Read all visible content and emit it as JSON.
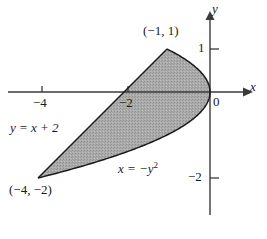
{
  "figure": {
    "kind": "cartesian-plot",
    "background_color": "#ffffff",
    "axis_color": "#3a3a3a",
    "curve_color": "#1a1a1a",
    "region_fill_color": "#a8a8a8",
    "axes": {
      "x_axis_label": "x",
      "y_axis_label": "y",
      "origin_label": "0",
      "x_ticks": [
        {
          "value": -4,
          "label": "−4"
        },
        {
          "value": -2,
          "label": "−2"
        }
      ],
      "y_ticks": [
        {
          "value": 1,
          "label": "1"
        },
        {
          "value": -2,
          "label": "−2"
        }
      ]
    },
    "point_labels": [
      {
        "label": "(−1, 1)",
        "x": -1,
        "y": 1
      },
      {
        "label": "(−4, −2)",
        "x": -4,
        "y": -2
      }
    ],
    "curve_labels": [
      {
        "id": "line",
        "text": "y = x + 2",
        "base": "y = x + ",
        "exponent": ""
      },
      {
        "id": "parabola",
        "base": "x = −y",
        "exponent": "2"
      }
    ]
  },
  "chart_data": {
    "type": "line",
    "title": "",
    "xlabel": "x",
    "ylabel": "y",
    "xlim": [
      -4.8,
      0.8
    ],
    "ylim": [
      -2.6,
      1.5
    ],
    "grid": false,
    "legend": "none",
    "annotations": [
      {
        "text": "(−1, 1)",
        "x": -1,
        "y": 1
      },
      {
        "text": "(−4, −2)",
        "x": -4,
        "y": -2
      },
      {
        "text": "y = x + 2",
        "x": -4.2,
        "y": -0.45
      },
      {
        "text": "x = −y²",
        "x": -1.9,
        "y": -1.5
      }
    ],
    "series": [
      {
        "name": "y = x + 2",
        "type": "line",
        "equation": "y = x + 2",
        "x": [
          -4,
          -1
        ],
        "values": [
          -2,
          1
        ]
      },
      {
        "name": "x = -y^2",
        "type": "line",
        "equation": "x = -y^2",
        "x": [
          -1,
          -0.8281,
          -0.64,
          -0.4761,
          -0.36,
          -0.2025,
          -0.09,
          -0.0225,
          0,
          -0.0225,
          -0.09,
          -0.2025,
          -0.36,
          -0.64,
          -1,
          -1.44,
          -1.96,
          -2.56,
          -3.24,
          -4
        ],
        "values": [
          1,
          0.91,
          0.8,
          0.69,
          0.6,
          0.45,
          0.3,
          0.15,
          0,
          -0.15,
          -0.3,
          -0.45,
          -0.6,
          -0.8,
          -1,
          -1.2,
          -1.4,
          -1.6,
          -1.8,
          -2
        ]
      }
    ],
    "shaded_region": {
      "description": "Region bounded above-left by the line y = x + 2 and on the right by the parabola x = -y^2, between the intersection points (-1, 1) and (-4, -2).",
      "fill": "#a8a8a8",
      "vertices": [
        {
          "x": -1,
          "y": 1
        },
        {
          "x": -4,
          "y": -2
        }
      ]
    },
    "intersections": [
      {
        "x": -1,
        "y": 1
      },
      {
        "x": -4,
        "y": -2
      }
    ]
  }
}
